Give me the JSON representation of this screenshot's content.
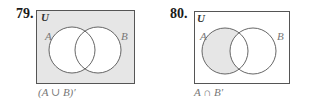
{
  "problems": [
    {
      "number": "79.",
      "universe_label": "U",
      "set_a_label": "A",
      "set_b_label": "B",
      "caption": "(A ∪ B)′",
      "shaded_region": "outside both circles"
    },
    {
      "number": "80.",
      "universe_label": "U",
      "set_a_label": "A",
      "set_b_label": "B",
      "caption": "A ∩ B′",
      "shaded_region": "A only"
    }
  ],
  "colors": {
    "shade": "#e6e6e6",
    "stroke": "#555555",
    "label": "#777777"
  }
}
